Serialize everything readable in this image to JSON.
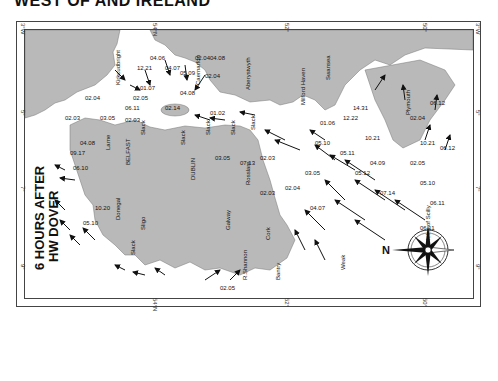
{
  "title": "WEST OF AND IRELAND",
  "map_title": {
    "line1": "6 HOURS AFTER",
    "line2": "HW DOVER"
  },
  "grid_ticks": {
    "top": [
      "3°W",
      "54°N",
      "52°",
      "50°"
    ],
    "bottom": [
      "54°N",
      "52°",
      "50°"
    ],
    "left": [
      "3°W",
      "5°",
      "7°",
      "9°"
    ],
    "right": [
      "3°W",
      "5°",
      "7°",
      "9°"
    ]
  },
  "places": [
    "Kirkcudbright",
    "Caernarfon",
    "Aberystwyth",
    "Milford Haven",
    "Swansea",
    "Plymouth",
    "Larne",
    "BELFAST",
    "DUBLIN",
    "Rosslare",
    "Cork",
    "Bantry",
    "R.Shannon",
    "Galway",
    "Sligo",
    "Donegal",
    "Isles of Scilly",
    "Weak"
  ],
  "rates": [
    "12.21",
    "04.06",
    "02.05",
    "01.07",
    "06.11",
    "04.07",
    "02.04",
    "05.09",
    "04.08",
    "02.04",
    "04.08",
    "02.14",
    "01.02",
    "03.05",
    "02.03",
    "02.04",
    "02.03",
    "04.08",
    "03.05",
    "07.13",
    "02.03",
    "02.03",
    "02.04",
    "03.05",
    "05.10",
    "01.06",
    "12.22",
    "14.31",
    "10.21",
    "05.11",
    "04.09",
    "05.12",
    "07.14",
    "04.07",
    "02.05",
    "10.21",
    "06.12",
    "02.04",
    "06.12",
    "05.10",
    "06.11",
    "06.11",
    "09.17",
    "06.10",
    "10.20",
    "05.10",
    "02.05"
  ],
  "slack_labels": [
    "Slack",
    "Slack",
    "Slack",
    "Slack",
    "Slack",
    "Slack"
  ],
  "compass": {
    "label": "N"
  },
  "colors": {
    "land": "#b9b9b9",
    "sea": "#ffffff",
    "arrow": "#111111",
    "frame": "#444444"
  }
}
